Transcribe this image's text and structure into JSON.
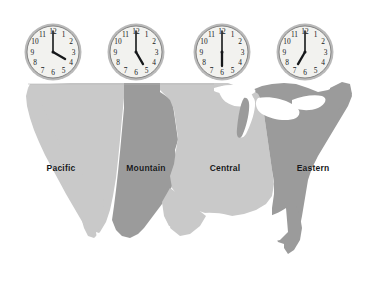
{
  "figure": {
    "background_color": "#ffffff",
    "width": 372,
    "height": 299
  },
  "map": {
    "name": "united-states-map",
    "outline_color": "#8f8f8f",
    "water_color": "#ffffff",
    "zones": [
      {
        "id": "pacific",
        "label": "Pacific",
        "fill": "#c9c9c9",
        "shade": "light",
        "label_x": 61,
        "label_y": 168
      },
      {
        "id": "mountain",
        "label": "Mountain",
        "fill": "#9b9b9b",
        "shade": "dark",
        "label_x": 146,
        "label_y": 168
      },
      {
        "id": "central",
        "label": "Central",
        "fill": "#c9c9c9",
        "shade": "light",
        "label_x": 225,
        "label_y": 168
      },
      {
        "id": "eastern",
        "label": "Eastern",
        "fill": "#9b9b9b",
        "shade": "dark",
        "label_x": 313,
        "label_y": 168
      }
    ]
  },
  "clocks": [
    {
      "id": "clock-pacific",
      "zone": "Pacific",
      "time": "4:00",
      "hour": 4,
      "minute": 0,
      "hour_angle": 120,
      "minute_angle": 0,
      "center_x": 53,
      "center_y": 52,
      "radius": 29,
      "face_color": "#f2f2ef",
      "rim_color": "#b9b9b9",
      "hand_color": "#16181a",
      "numerals": [
        "12",
        "1",
        "2",
        "3",
        "4",
        "5",
        "6",
        "7",
        "8",
        "9",
        "10",
        "11"
      ]
    },
    {
      "id": "clock-mountain",
      "zone": "Mountain",
      "time": "5:00",
      "hour": 5,
      "minute": 0,
      "hour_angle": 150,
      "minute_angle": 0,
      "center_x": 136,
      "center_y": 52,
      "radius": 29,
      "face_color": "#f2f2ef",
      "rim_color": "#b9b9b9",
      "hand_color": "#16181a",
      "numerals": [
        "12",
        "1",
        "2",
        "3",
        "4",
        "5",
        "6",
        "7",
        "8",
        "9",
        "10",
        "11"
      ]
    },
    {
      "id": "clock-central",
      "zone": "Central",
      "time": "6:00",
      "hour": 6,
      "minute": 0,
      "hour_angle": 180,
      "minute_angle": 0,
      "center_x": 222,
      "center_y": 52,
      "radius": 29,
      "face_color": "#f2f2ef",
      "rim_color": "#b9b9b9",
      "hand_color": "#16181a",
      "numerals": [
        "12",
        "1",
        "2",
        "3",
        "4",
        "5",
        "6",
        "7",
        "8",
        "9",
        "10",
        "11"
      ]
    },
    {
      "id": "clock-eastern",
      "zone": "Eastern",
      "time": "7:00",
      "hour": 7,
      "minute": 0,
      "hour_angle": 210,
      "minute_angle": 0,
      "center_x": 305,
      "center_y": 52,
      "radius": 29,
      "face_color": "#f2f2ef",
      "rim_color": "#b9b9b9",
      "hand_color": "#16181a",
      "numerals": [
        "12",
        "1",
        "2",
        "3",
        "4",
        "5",
        "6",
        "7",
        "8",
        "9",
        "10",
        "11"
      ]
    }
  ]
}
